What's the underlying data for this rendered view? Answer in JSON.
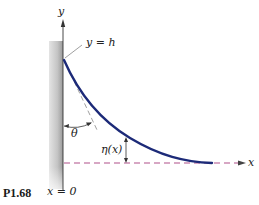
{
  "figure": {
    "number": "P1.68",
    "labels": {
      "y_axis": "y",
      "x_axis": "x",
      "top_point": "y = h",
      "angle": "θ",
      "height_fn": "η(x)",
      "origin": "x = 0"
    },
    "colors": {
      "curve": "#1c2a78",
      "baseline": "#b0508a",
      "wall": "#b8b8b8",
      "axis": "#333333",
      "tangent": "#777777"
    }
  }
}
